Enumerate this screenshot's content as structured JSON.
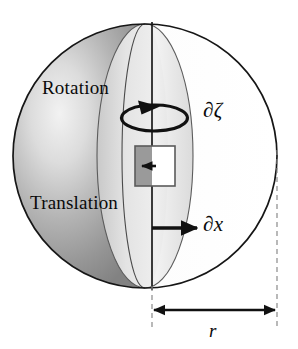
{
  "figure": {
    "kind": "diagram",
    "background_color": "#ffffff"
  },
  "labels": {
    "rotation": "Rotation",
    "translation": "Translation",
    "partial_zeta": "∂ζ",
    "partial_x": "∂x",
    "radius": "r"
  },
  "icon_names": {
    "rotation_arrow": "rotation-arrow-icon",
    "translation_arrow": "translation-arrow-icon",
    "element_arrow": "element-arrow-icon",
    "dimension_arrow": "dimension-double-arrow-icon"
  },
  "geometry": {
    "sphere": {
      "cx": 145,
      "cy": 156,
      "r": 132
    },
    "axis_x": 152,
    "lens": {
      "cx": 145,
      "cy": 156,
      "rx": 48,
      "ry": 132
    },
    "terminator": {
      "cx": 145,
      "cy": 156,
      "rx": 23,
      "ry": 132
    },
    "element_square": {
      "x": 135,
      "y": 146,
      "w": 40,
      "h": 40
    },
    "rotation_ellipse": {
      "cx": 152,
      "cy": 118,
      "rx": 33,
      "ry": 13
    },
    "translation_arrow": {
      "x1": 152,
      "y1": 228,
      "x2": 200,
      "y2": 228
    },
    "dimension_line": {
      "x1": 152,
      "x2": 277,
      "y": 310
    },
    "dashed_left_x": 152,
    "dashed_right_x": 277
  },
  "colors": {
    "outline": "#1a1a1a",
    "sphere_white": "#ffffff",
    "hemisphere_dark": "#8c8c8c",
    "hemisphere_highlight": "#e2e2e2",
    "lens_light": "#e8e8e8",
    "element_gray": "#9a9a9a",
    "element_white": "#ffffff",
    "dashed": "#8a8a8a",
    "text": "#0a0a0a"
  }
}
